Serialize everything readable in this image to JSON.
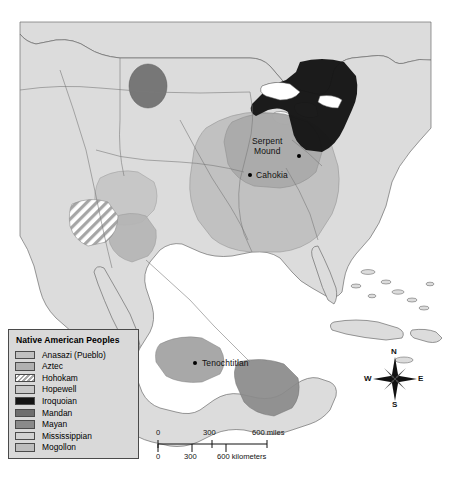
{
  "map": {
    "title": "Native American Peoples",
    "cities": [
      {
        "name": "Serpent Mound",
        "line1": "Serpent",
        "line2": "Mound",
        "x": 272,
        "y": 143
      },
      {
        "name": "Cahokia",
        "line1": "Cahokia",
        "line2": "",
        "x": 250,
        "y": 175
      },
      {
        "name": "Tenochtitlan",
        "line1": "Tenochtitlan",
        "line2": "",
        "x": 195,
        "y": 362
      }
    ],
    "legend": {
      "title": "Native American Peoples",
      "items": [
        {
          "label": "Anasazi (Pueblo)",
          "color": "#c0c0c0",
          "pattern": "solid"
        },
        {
          "label": "Aztec",
          "color": "#b0b0b0",
          "pattern": "solid"
        },
        {
          "label": "Hohokam",
          "color": "#ffffff",
          "pattern": "hatch"
        },
        {
          "label": "Hopewell",
          "color": "#c8c8c8",
          "pattern": "solid"
        },
        {
          "label": "Iroquoian",
          "color": "#151515",
          "pattern": "solid"
        },
        {
          "label": "Mandan",
          "color": "#6e6e6e",
          "pattern": "solid"
        },
        {
          "label": "Mayan",
          "color": "#8a8a8a",
          "pattern": "solid"
        },
        {
          "label": "Mississippian",
          "color": "#d2d2d2",
          "pattern": "solid"
        },
        {
          "label": "Mogollon",
          "color": "#bdbdbd",
          "pattern": "solid"
        }
      ]
    },
    "scale": {
      "miles_unit": "miles",
      "km_unit": "kilometers",
      "miles_ticks": [
        "0",
        "300",
        "600 miles"
      ],
      "km_ticks": [
        "0",
        "300",
        "600 kilometers"
      ]
    },
    "compass": {
      "north": "N",
      "east": "E",
      "south": "S",
      "west": "W"
    },
    "colors": {
      "ocean": "#ffffff",
      "land": "#dcdcdc",
      "outline": "#6d6d6d",
      "legend_bg": "#d9d9d9",
      "legend_border": "#4a4a4a"
    }
  }
}
